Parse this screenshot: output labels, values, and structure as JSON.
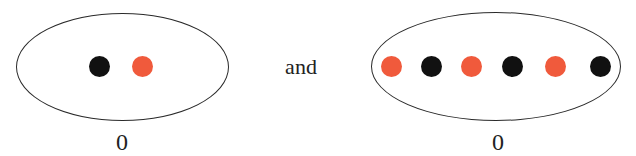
{
  "diagram": {
    "colors": {
      "black_dot": "#111111",
      "red_dot": "#f05a3c",
      "outline": "#2a2a2a"
    },
    "left": {
      "dots": [
        {
          "color": "black",
          "x": 100
        },
        {
          "color": "red",
          "x": 143
        }
      ],
      "label": "0"
    },
    "connector": "and",
    "right": {
      "dots": [
        {
          "color": "red",
          "x": 392
        },
        {
          "color": "black",
          "x": 432
        },
        {
          "color": "red",
          "x": 472
        },
        {
          "color": "black",
          "x": 513
        },
        {
          "color": "red",
          "x": 556
        },
        {
          "color": "black",
          "x": 601
        }
      ],
      "label": "0"
    }
  }
}
